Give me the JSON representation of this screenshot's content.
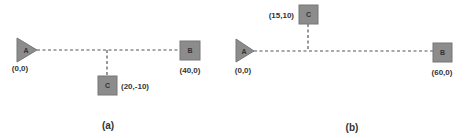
{
  "colors": {
    "node_fill": "#8c8c8c",
    "node_stroke": "#777777",
    "line": "#555555",
    "text": "#333333"
  },
  "panels": [
    {
      "caption": "(a)",
      "nodes": [
        {
          "id": "A",
          "shape": "triangle",
          "label": "A",
          "coord_label": "(0,0)"
        },
        {
          "id": "B",
          "shape": "square",
          "label": "B",
          "coord_label": "(40,0)"
        },
        {
          "id": "C",
          "shape": "square",
          "label": "C",
          "coord_label": "(20,-10)"
        }
      ]
    },
    {
      "caption": "(b)",
      "nodes": [
        {
          "id": "A",
          "shape": "triangle",
          "label": "A",
          "coord_label": "(0,0)"
        },
        {
          "id": "B",
          "shape": "square",
          "label": "B",
          "coord_label": "(60,0)"
        },
        {
          "id": "C",
          "shape": "square",
          "label": "C",
          "coord_label": "(15,10)"
        }
      ]
    }
  ]
}
